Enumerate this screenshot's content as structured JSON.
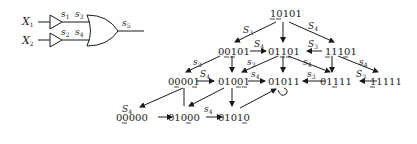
{
  "circuit": {
    "inputs": [
      {
        "name": "X",
        "sub": "1"
      },
      {
        "name": "X",
        "sub": "2"
      }
    ],
    "buffer_labels": [
      {
        "name": "s",
        "sub": "1"
      },
      {
        "name": "s",
        "sub": "2"
      }
    ],
    "gate_input_labels": [
      {
        "name": "s",
        "sub": "3"
      },
      {
        "name": "s",
        "sub": "4"
      }
    ],
    "output_label": {
      "name": "s",
      "sub": "5"
    }
  },
  "graph": {
    "nodes": [
      {
        "id": "n10101",
        "text": "10101",
        "underlined": [
          0,
          1
        ]
      },
      {
        "id": "n00101",
        "text": "00101",
        "underlined": [
          1,
          2
        ]
      },
      {
        "id": "n01101",
        "text": "01101",
        "underlined": [
          2,
          3
        ]
      },
      {
        "id": "n11101",
        "text": "11101",
        "underlined": [
          0,
          3
        ]
      },
      {
        "id": "n00001",
        "text": "00001",
        "underlined": [
          1,
          4
        ]
      },
      {
        "id": "n01001",
        "text": "01001",
        "underlined": [
          3,
          4
        ]
      },
      {
        "id": "n01011",
        "text": "01011",
        "underlined": []
      },
      {
        "id": "n01111",
        "text": "01111",
        "underlined": [
          2
        ]
      },
      {
        "id": "n11111",
        "text": "11111",
        "underlined": [
          0
        ]
      },
      {
        "id": "n00000",
        "text": "00000",
        "underlined": [
          1
        ]
      },
      {
        "id": "n01000",
        "text": "01000",
        "underlined": [
          3
        ]
      },
      {
        "id": "n01010",
        "text": "01010",
        "underlined": [
          4
        ]
      }
    ],
    "edge_labels": {
      "top_left": {
        "name": "S",
        "sub": "3"
      },
      "top_right": {
        "name": "S",
        "sub": "4"
      },
      "row1_left": {
        "name": "S",
        "sub": "4"
      },
      "row1_right": {
        "name": "S",
        "sub": "3"
      },
      "diag1": {
        "name": "s",
        "sub": "3"
      },
      "diag2": {
        "name": "s",
        "sub": "3"
      },
      "diag3": {
        "name": "s",
        "sub": "3"
      },
      "diag4": {
        "name": "s",
        "sub": "4"
      },
      "diag5": {
        "name": "s",
        "sub": "4"
      },
      "row2_a": {
        "name": "S",
        "sub": "4"
      },
      "row2_b": {
        "name": "s",
        "sub": "4"
      },
      "row2_c": {
        "name": "s",
        "sub": "3"
      },
      "row2_d": {
        "name": "S",
        "sub": "3"
      },
      "row3_a": {
        "name": "S",
        "sub": "4"
      },
      "row3_b": {
        "name": "s",
        "sub": "4"
      }
    }
  }
}
